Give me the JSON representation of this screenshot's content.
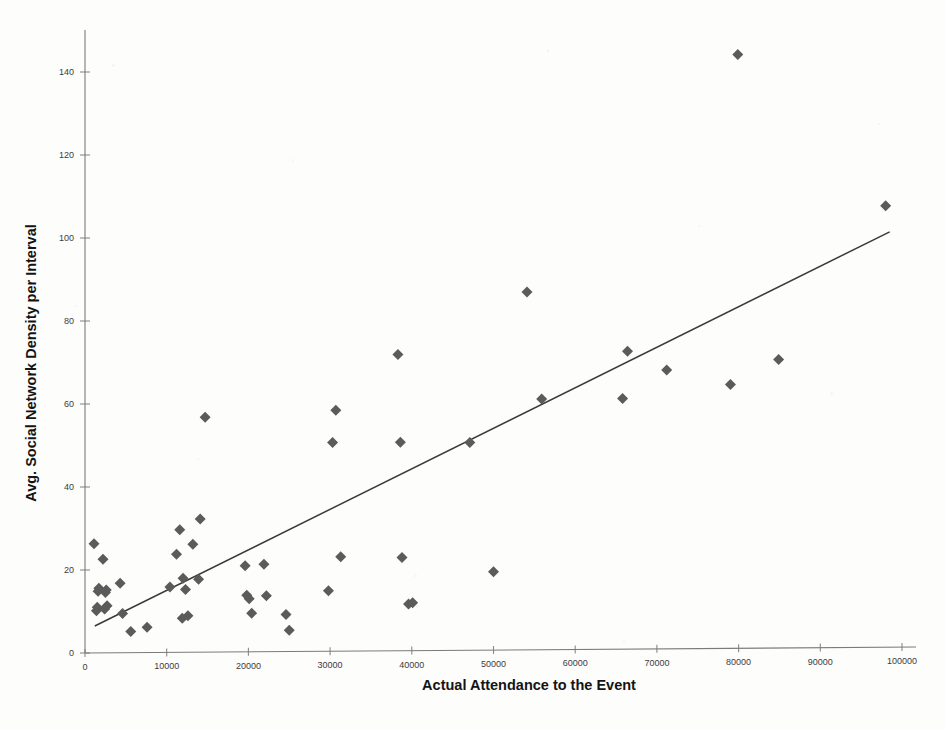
{
  "chart_data": {
    "type": "scatter",
    "title": "",
    "xlabel": "Actual Attendance to the Event",
    "ylabel": "Avg. Social Network Density per Interval",
    "xlim": [
      0,
      100000
    ],
    "ylim": [
      0,
      150
    ],
    "xticks": [
      0,
      10000,
      20000,
      30000,
      40000,
      50000,
      60000,
      70000,
      80000,
      90000,
      100000
    ],
    "xtick_labels": [
      "0",
      "10000",
      "20000",
      "30000",
      "40000",
      "50000",
      "60000",
      "70000",
      "80000",
      "90000",
      "100000"
    ],
    "yticks": [
      0,
      20,
      40,
      60,
      80,
      100,
      120,
      140
    ],
    "ytick_labels": [
      "0",
      "20",
      "40",
      "60",
      "80",
      "100",
      "120",
      "140"
    ],
    "grid": false,
    "legend": "none",
    "marker_shape": "diamond",
    "marker_color": "#5b5b5b",
    "marker_size": 5.5,
    "trendline": {
      "shown": true,
      "color": "#3a3a3a",
      "x_start": 1200,
      "y_start": 6.5,
      "x_end": 98500,
      "y_end": 101.5
    },
    "points": [
      {
        "x": 1100,
        "y": 26.3
      },
      {
        "x": 1600,
        "y": 14.9
      },
      {
        "x": 1700,
        "y": 15.6
      },
      {
        "x": 1400,
        "y": 10.2
      },
      {
        "x": 1500,
        "y": 11.0
      },
      {
        "x": 2200,
        "y": 22.6
      },
      {
        "x": 2500,
        "y": 14.6
      },
      {
        "x": 2600,
        "y": 15.2
      },
      {
        "x": 2400,
        "y": 10.6
      },
      {
        "x": 2700,
        "y": 11.4
      },
      {
        "x": 4300,
        "y": 16.8
      },
      {
        "x": 4600,
        "y": 9.5
      },
      {
        "x": 5600,
        "y": 5.2
      },
      {
        "x": 7600,
        "y": 6.2
      },
      {
        "x": 10400,
        "y": 15.9
      },
      {
        "x": 11200,
        "y": 23.8
      },
      {
        "x": 11600,
        "y": 29.7
      },
      {
        "x": 12000,
        "y": 18.0
      },
      {
        "x": 12300,
        "y": 15.3
      },
      {
        "x": 11900,
        "y": 8.4
      },
      {
        "x": 12600,
        "y": 9.0
      },
      {
        "x": 13200,
        "y": 26.2
      },
      {
        "x": 13900,
        "y": 17.8
      },
      {
        "x": 14100,
        "y": 32.3
      },
      {
        "x": 14700,
        "y": 56.8
      },
      {
        "x": 19600,
        "y": 21.0
      },
      {
        "x": 19800,
        "y": 13.9
      },
      {
        "x": 20100,
        "y": 13.1
      },
      {
        "x": 20400,
        "y": 9.6
      },
      {
        "x": 21900,
        "y": 21.4
      },
      {
        "x": 22200,
        "y": 13.8
      },
      {
        "x": 24600,
        "y": 9.3
      },
      {
        "x": 25000,
        "y": 5.5
      },
      {
        "x": 29800,
        "y": 15.0
      },
      {
        "x": 30300,
        "y": 50.7
      },
      {
        "x": 30700,
        "y": 58.5
      },
      {
        "x": 31300,
        "y": 23.2
      },
      {
        "x": 38300,
        "y": 71.9
      },
      {
        "x": 38600,
        "y": 50.8
      },
      {
        "x": 38800,
        "y": 23.0
      },
      {
        "x": 39600,
        "y": 11.8
      },
      {
        "x": 40100,
        "y": 12.1
      },
      {
        "x": 47100,
        "y": 50.7
      },
      {
        "x": 50000,
        "y": 19.6
      },
      {
        "x": 54100,
        "y": 87.0
      },
      {
        "x": 55900,
        "y": 61.2
      },
      {
        "x": 65800,
        "y": 61.3
      },
      {
        "x": 66400,
        "y": 72.7
      },
      {
        "x": 71200,
        "y": 68.2
      },
      {
        "x": 79000,
        "y": 64.7
      },
      {
        "x": 79900,
        "y": 144.2
      },
      {
        "x": 84900,
        "y": 70.7
      },
      {
        "x": 98000,
        "y": 107.8
      }
    ]
  }
}
